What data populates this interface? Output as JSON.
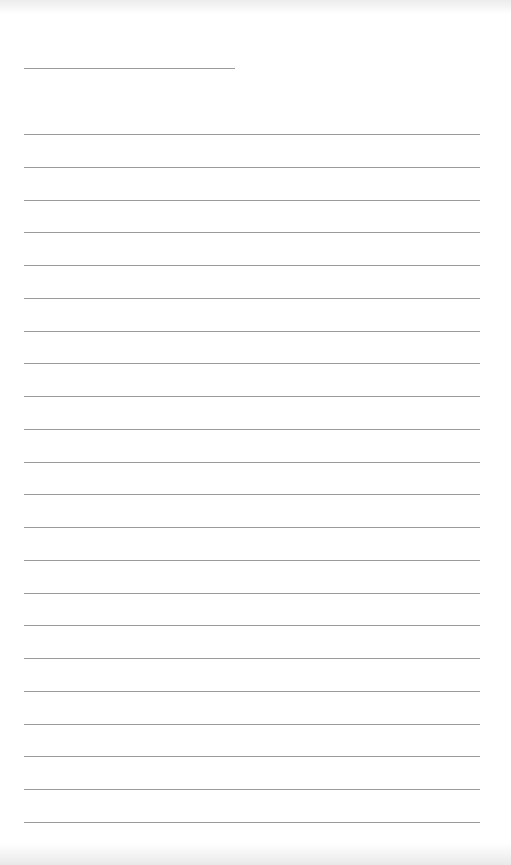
{
  "page": {
    "type": "lined-paper",
    "header_line": {
      "x": 24,
      "y": 68,
      "width": 211
    },
    "rules": {
      "count": 22,
      "x": 24,
      "width": 456,
      "first_y": 134,
      "spacing": 32.75
    },
    "colors": {
      "background": "#ffffff",
      "line": "#9a9a9a"
    }
  }
}
